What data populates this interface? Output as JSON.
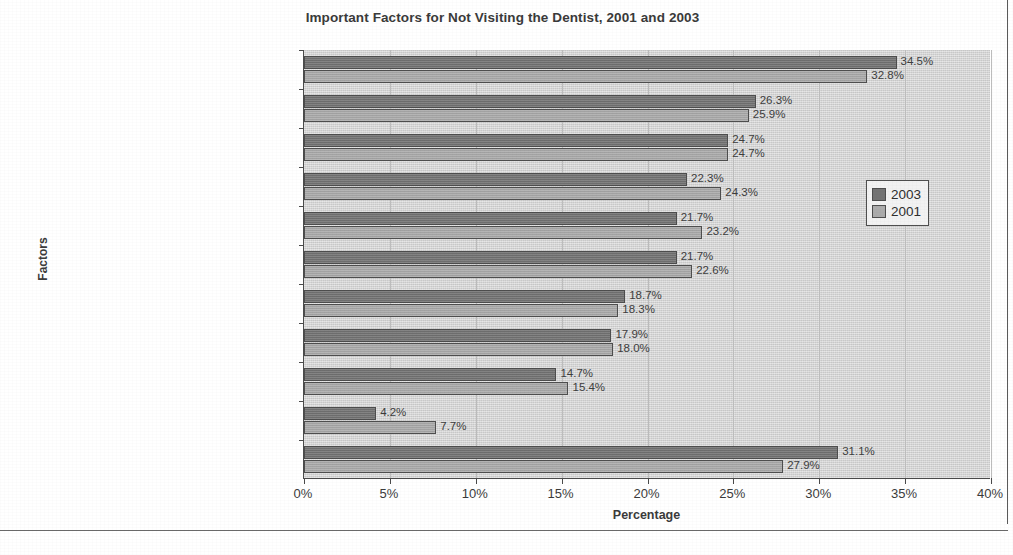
{
  "chart_data": {
    "type": "bar",
    "orientation": "horizontal",
    "title": "Important Factors for Not Visiting the Dentist, 2001 and 2003",
    "xlabel": "Percentage",
    "ylabel": "Factors",
    "xlim": [
      0,
      40
    ],
    "xticks": [
      "0%",
      "5%",
      "10%",
      "15%",
      "20%",
      "25%",
      "30%",
      "35%",
      "40%"
    ],
    "xtick_values": [
      0,
      5,
      10,
      15,
      20,
      25,
      30,
      35,
      40
    ],
    "grid": true,
    "legend_position": "right",
    "categories": [
      "Cost too much",
      "Previous bad experience",
      "Not necessary until a problem occurs",
      "Not knowing a good dentist",
      "Fear of pain",
      "Inconvenient office hours",
      "Length of time kept waiting",
      "Uncertainty about care",
      "More important things to do",
      "Other",
      "None"
    ],
    "series": [
      {
        "name": "2003",
        "color": "#737373",
        "values": [
          34.5,
          26.3,
          24.7,
          22.3,
          21.7,
          21.7,
          18.7,
          17.9,
          14.7,
          4.2,
          31.1
        ],
        "labels": [
          "34.5%",
          "26.3%",
          "24.7%",
          "22.3%",
          "21.7%",
          "21.7%",
          "18.7%",
          "17.9%",
          "14.7%",
          "4.2%",
          "31.1%"
        ]
      },
      {
        "name": "2001",
        "color": "#ababab",
        "values": [
          32.8,
          25.9,
          24.7,
          24.3,
          23.2,
          22.6,
          18.3,
          18.0,
          15.4,
          7.7,
          27.9
        ],
        "labels": [
          "32.8%",
          "25.9%",
          "24.7%",
          "24.3%",
          "23.2%",
          "22.6%",
          "18.3%",
          "18.0%",
          "15.4%",
          "7.7%",
          "27.9%"
        ]
      }
    ]
  },
  "legend": {
    "entries": [
      {
        "label": "2003",
        "color": "#737373"
      },
      {
        "label": "2001",
        "color": "#ababab"
      }
    ]
  },
  "colors": {
    "series_2003": "#737373",
    "series_2001": "#ababab",
    "plot_background": "#d2d2d2",
    "axis": "#4a4a4a",
    "text": "#3b3b3b"
  }
}
